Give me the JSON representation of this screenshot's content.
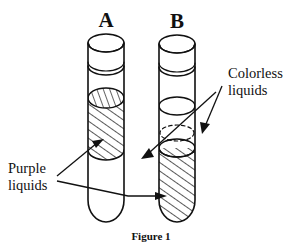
{
  "figure": {
    "caption": "Figure 1",
    "tubes": [
      {
        "id": "A",
        "label": "A",
        "contents_top_to_bottom": [
          "purple liquid",
          "colorless liquid"
        ],
        "hatched_region": "upper",
        "clear_region": "lower"
      },
      {
        "id": "B",
        "label": "B",
        "contents_top_to_bottom": [
          "colorless liquid",
          "purple liquid"
        ],
        "hatched_region": "lower",
        "clear_region": "upper"
      }
    ],
    "callouts": [
      {
        "name": "purple-liquids",
        "line1": "Purple",
        "line2": "liquids",
        "points_to": [
          "tube-A-upper-layer",
          "tube-B-lower-layer"
        ]
      },
      {
        "name": "colorless-liquids",
        "line1": "Colorless",
        "line2": "liquids",
        "points_to": [
          "tube-A-lower-layer",
          "tube-B-upper-layer"
        ]
      }
    ]
  },
  "colors": {
    "ink": "#111111",
    "background": "#ffffff"
  }
}
